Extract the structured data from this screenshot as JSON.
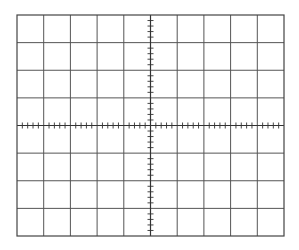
{
  "graticule": {
    "type": "oscilloscope-graticule",
    "x0": 17,
    "y0": 15,
    "width": 267,
    "height": 221,
    "horizontal_divisions": 10,
    "vertical_divisions": 8,
    "minor_ticks_per_division": 5,
    "minor_tick_length": 6,
    "colors": {
      "background": "#ffffff",
      "grid_line": "#555555",
      "border": "#444444",
      "axis": "#333333",
      "tick": "#333333"
    }
  }
}
